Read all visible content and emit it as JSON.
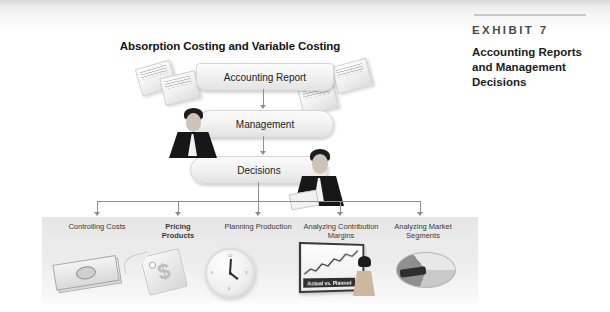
{
  "exhibit": {
    "kicker": "EXHIBIT 7",
    "title": "Accounting Reports and Management Decisions"
  },
  "figure": {
    "title": "Absorption Costing and Variable Costing",
    "nodes": {
      "report": "Accounting Report",
      "management": "Management",
      "decisions": "Decisions"
    },
    "branches": [
      {
        "label_line1": "Controlling Costs",
        "label_line2": "",
        "icon": "money-icon",
        "bold": false
      },
      {
        "label_line1": "Pricing",
        "label_line2": "Products",
        "icon": "price-tag-icon",
        "bold": true
      },
      {
        "label_line1": "Planning Production",
        "label_line2": "",
        "icon": "clock-icon",
        "bold": false
      },
      {
        "label_line1": "Analyzing Contribution",
        "label_line2": "Margins",
        "icon": "presentation-chart-icon",
        "bold": false
      },
      {
        "label_line1": "Analyzing Market",
        "label_line2": "Segments",
        "icon": "pie-chart-icon",
        "bold": false
      }
    ],
    "chart_label": "Actual vs. Planned",
    "tag_symbol": "$",
    "clock_marks": [
      "12",
      "3",
      "6",
      "9"
    ]
  },
  "colors": {
    "page": "#ffffff",
    "band": "#e6e6e6",
    "line": "#8f8f8f",
    "text": "#2b2b2b"
  }
}
